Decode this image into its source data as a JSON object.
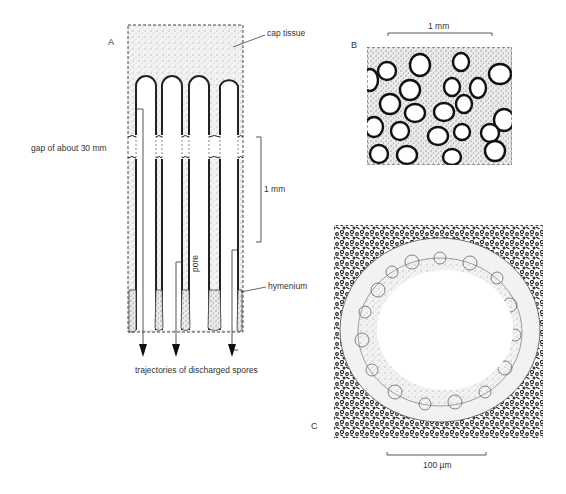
{
  "figure": {
    "panels": [
      {
        "id": "A",
        "letter": "A",
        "description": "Longitudinal section of pores beneath cap tissue"
      },
      {
        "id": "B",
        "letter": "B",
        "description": "Surface view of pore openings"
      },
      {
        "id": "C",
        "letter": "C",
        "description": "Transverse section of a single pore lined with hymenium"
      }
    ],
    "labels": {
      "cap_tissue": "cap tissue",
      "gap": "gap of about 30 mm",
      "scale_a": "1 mm",
      "pore": "pore",
      "hymenium": "hymenium",
      "trajectories": "trajectories of discharged spores",
      "scale_b": "1 mm",
      "scale_c": "100 µm"
    }
  }
}
